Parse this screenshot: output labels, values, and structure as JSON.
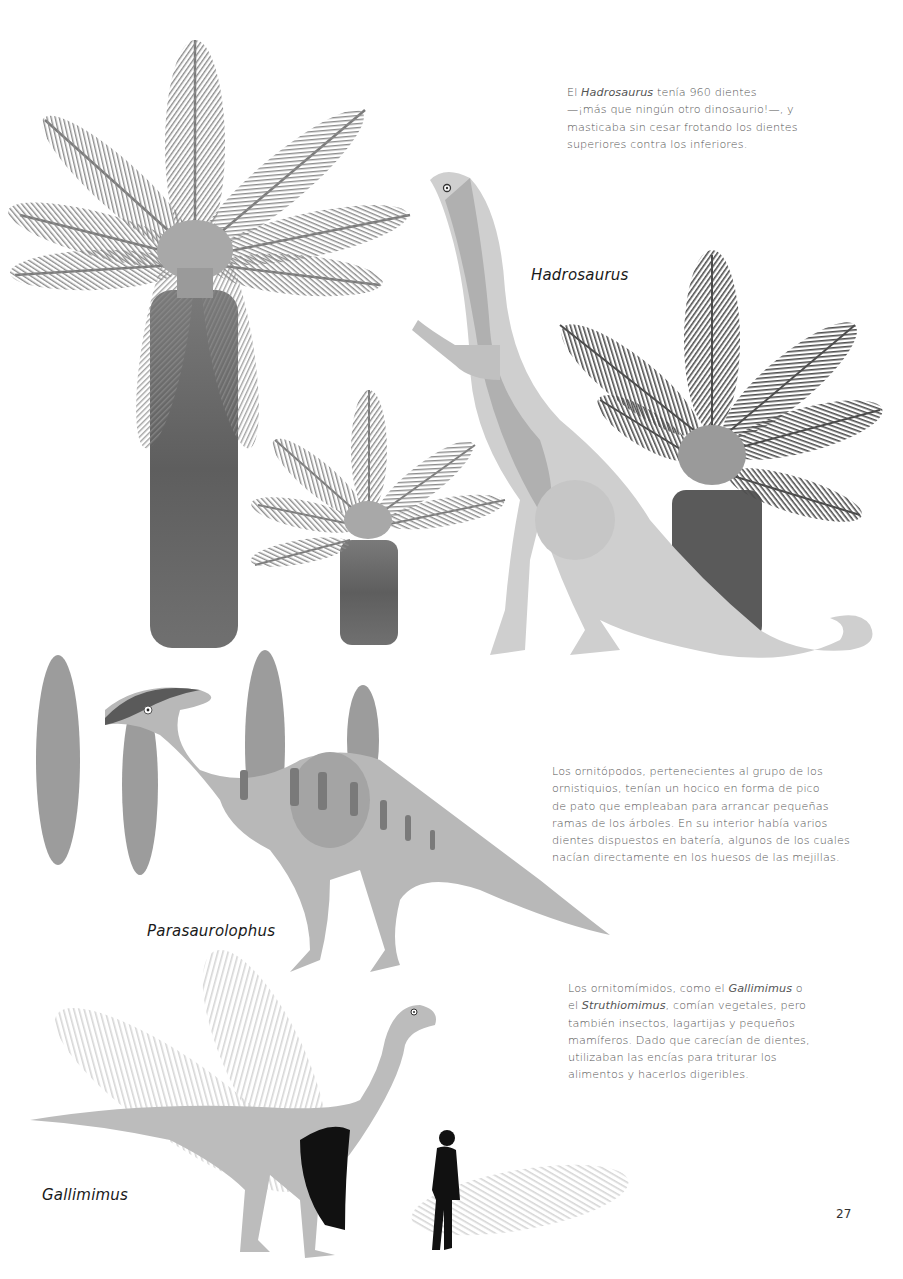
{
  "page": {
    "number": "27",
    "background": "#ffffff"
  },
  "texts": {
    "hadrosaurus_para": {
      "pre": "El ",
      "italic": "Hadrosaurus",
      "line1_rest": " tenía 960 dientes",
      "line2": "—¡más que ningún otro dinosaurio!—, y",
      "line3": "masticaba sin cesar frotando los dientes",
      "line4": "superiores contra los inferiores."
    },
    "ornithopods_para": {
      "lines": [
        "Los ornitópodos, pertenecientes al grupo de los",
        "ornistiquios, tenían un hocico en forma de pico",
        "de pato que empleaban para arrancar pequeñas",
        "ramas de los árboles. En su interior había varios",
        "dientes dispuestos en batería, algunos de los cuales",
        "nacían directamente en los huesos de las mejillas."
      ]
    },
    "ornithomimids_para": {
      "l1_pre": "Los ornitomímidos, como el ",
      "l1_italic": "Gallimimus",
      "l1_post": " o",
      "l2_pre": "el ",
      "l2_italic": "Struthiomimus",
      "l2_post": ", comían vegetales, pero",
      "l3": "también insectos, lagartijas y pequeños",
      "l4": "mamíferos. Dado que carecían de dientes,",
      "l5": "utilizaban las encías para triturar los",
      "l6": "alimentos y hacerlos digeribles."
    }
  },
  "labels": {
    "hadrosaurus": "Hadrosaurus",
    "parasaurolophus": "Parasaurolophus",
    "gallimimus": "Gallimimus"
  },
  "illustrations": [
    {
      "name": "cycad-large",
      "color": "#8a8a8a"
    },
    {
      "name": "cycad-small",
      "color": "#8a8a8a"
    },
    {
      "name": "cycad-dark",
      "color": "#555555"
    },
    {
      "name": "hadrosaurus",
      "color": "#c8c8c8"
    },
    {
      "name": "parasaurolophus",
      "color": "#b5b5b5"
    },
    {
      "name": "fern-fronds",
      "color": "#9a9a9a"
    },
    {
      "name": "gallimimus",
      "color": "#b8b8b8"
    },
    {
      "name": "human-silhouette",
      "color": "#111111"
    }
  ]
}
